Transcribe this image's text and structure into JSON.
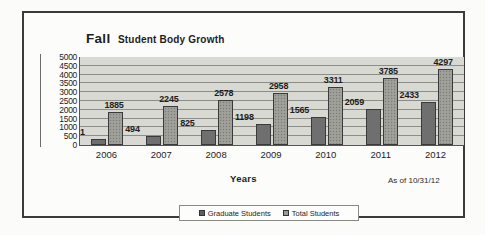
{
  "chart_data": {
    "type": "bar",
    "title": "Fall Student Body Growth",
    "title_emphasis": "Fall",
    "title_remainder": "Student Body Growth",
    "xlabel": "Years",
    "ylabel": "",
    "categories": [
      "2006",
      "2007",
      "2008",
      "2009",
      "2010",
      "2011",
      "2012"
    ],
    "series": [
      {
        "name": "Graduate Students",
        "values": [
          361,
          494,
          825,
          1198,
          1565,
          2059,
          2433
        ],
        "color": "#6f6f6f"
      },
      {
        "name": "Total Students",
        "values": [
          1885,
          2245,
          2578,
          2958,
          3311,
          3785,
          4297
        ],
        "color": "#9b9b96"
      }
    ],
    "ylim": [
      0,
      5000
    ],
    "ytick_labels": [
      "5000",
      "4500",
      "4000",
      "3500",
      "3000",
      "2500",
      "2000",
      "1500",
      "1000",
      "500",
      "0"
    ],
    "ytick_values": [
      5000,
      4500,
      4000,
      3500,
      3000,
      2500,
      2000,
      1500,
      1000,
      500,
      0
    ],
    "grid": true,
    "data_labels": true,
    "legend_position": "bottom",
    "annotation": "As of 10/31/12",
    "plot_background": "#d9d9d4",
    "frame_color": "#3b3b3b"
  }
}
